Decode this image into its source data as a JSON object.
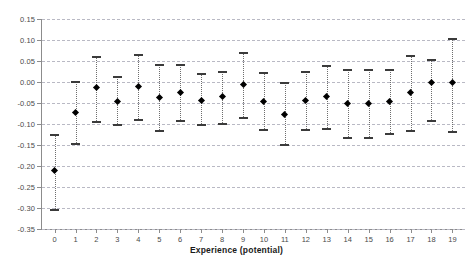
{
  "chart_data": {
    "type": "scatter",
    "title": "",
    "xlabel": "Experience (potential)",
    "ylabel": "",
    "grid": true,
    "legend": "none",
    "xlim": [
      -0.6,
      19.6
    ],
    "ylim": [
      -0.35,
      0.15
    ],
    "ytick_labels": [
      "0.15",
      "0.10",
      "0.05",
      "0.00",
      "-0.05",
      "-0.10",
      "-0.15",
      "-0.20",
      "-0.25",
      "-0.30",
      "-0.35"
    ],
    "ytick_values": [
      0.15,
      0.1,
      0.05,
      0.0,
      -0.05,
      -0.1,
      -0.15,
      -0.2,
      -0.25,
      -0.3,
      -0.35
    ],
    "categories": [
      "0",
      "1",
      "2",
      "3",
      "4",
      "5",
      "6",
      "7",
      "8",
      "9",
      "10",
      "11",
      "12",
      "13",
      "14",
      "15",
      "16",
      "17",
      "18",
      "19"
    ],
    "x": [
      0,
      1,
      2,
      3,
      4,
      5,
      6,
      7,
      8,
      9,
      10,
      11,
      12,
      13,
      14,
      15,
      16,
      17,
      18,
      19
    ],
    "values": [
      -0.21,
      -0.072,
      -0.013,
      -0.046,
      -0.01,
      -0.036,
      -0.026,
      -0.043,
      -0.034,
      -0.005,
      -0.047,
      -0.077,
      -0.044,
      -0.035,
      -0.051,
      -0.05,
      -0.047,
      -0.025,
      -0.002,
      0.0
    ],
    "ci_low": [
      -0.303,
      -0.146,
      -0.092,
      -0.101,
      -0.088,
      -0.114,
      -0.09,
      -0.101,
      -0.097,
      -0.083,
      -0.113,
      -0.147,
      -0.112,
      -0.11,
      -0.132,
      -0.13,
      -0.122,
      -0.114,
      -0.09,
      -0.117
    ],
    "ci_high": [
      -0.123,
      0.002,
      0.061,
      0.014,
      0.066,
      0.043,
      0.044,
      0.021,
      0.027,
      0.072,
      0.023,
      0.0,
      0.027,
      0.04,
      0.031,
      0.031,
      0.03,
      0.064,
      0.054,
      0.104
    ],
    "series": [
      {
        "name": "point estimate",
        "marker": "filled-diamond"
      },
      {
        "name": "confidence interval",
        "marker": "capped-dotted-line"
      }
    ]
  },
  "colors": {
    "marker": "#000000",
    "cap": "#3b3b3b",
    "errorbar": "#6e6e6e",
    "grid": "#b9b9c4",
    "axis": "#8c8c8c",
    "tick_text": "#4a4a4a",
    "title_text": "#1a1a1a",
    "background": "#ffffff"
  }
}
